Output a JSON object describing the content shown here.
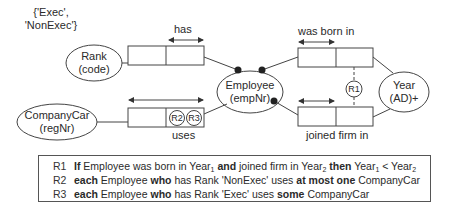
{
  "diagram": {
    "value_constraint": {
      "line1": "{'Exec',",
      "line2": "'NonExec'}"
    },
    "entities": {
      "rank": {
        "name": "Rank",
        "ref": "(code)"
      },
      "company_car": {
        "name": "CompanyCar",
        "ref": "(regNr)"
      },
      "employee": {
        "name": "Employee",
        "ref": "(empNr)"
      },
      "year": {
        "name": "Year",
        "ref": "(AD)+"
      }
    },
    "fact_types": {
      "has": {
        "reading": "has"
      },
      "uses": {
        "reading": "uses",
        "constraints": [
          "R2",
          "R3"
        ]
      },
      "was_born_in": {
        "reading": "was born in"
      },
      "joined_firm_in": {
        "reading": "joined firm in"
      }
    },
    "subset_constraint": {
      "label": "R1"
    }
  },
  "rules": [
    {
      "id": "R1",
      "parts": [
        {
          "t": "If",
          "b": true
        },
        {
          "t": " Employee was born in Year"
        },
        {
          "sub": "1"
        },
        {
          "t": " and",
          "b": true
        },
        {
          "t": " joined firm in Year"
        },
        {
          "sub": "2"
        },
        {
          "t": " then",
          "b": true
        },
        {
          "t": " Year"
        },
        {
          "sub": "1"
        },
        {
          "t": " < Year"
        },
        {
          "sub": "2"
        }
      ]
    },
    {
      "id": "R2",
      "parts": [
        {
          "t": "each",
          "b": true
        },
        {
          "t": " Employee "
        },
        {
          "t": "who",
          "b": true
        },
        {
          "t": " has Rank 'NonExec' uses "
        },
        {
          "t": "at most one",
          "b": true
        },
        {
          "t": " CompanyCar"
        }
      ]
    },
    {
      "id": "R3",
      "parts": [
        {
          "t": "each",
          "b": true
        },
        {
          "t": " Employee "
        },
        {
          "t": "who",
          "b": true
        },
        {
          "t": " has Rank 'Exec' uses "
        },
        {
          "t": "some",
          "b": true
        },
        {
          "t": " CompanyCar"
        }
      ]
    }
  ]
}
